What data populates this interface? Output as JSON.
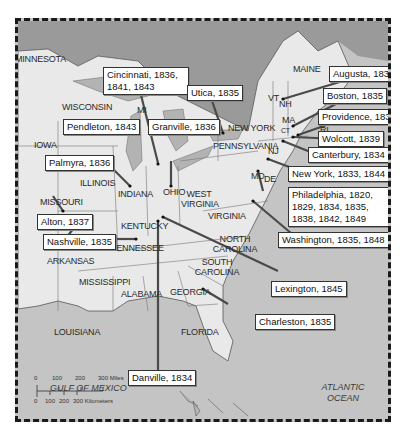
{
  "map": {
    "callouts": [
      {
        "id": "cincinnati",
        "label": "Cincinnati, 1836, 1841, 1843"
      },
      {
        "id": "utica",
        "label": "Utica, 1835"
      },
      {
        "id": "augusta",
        "label": "Augusta, 1834"
      },
      {
        "id": "boston",
        "label": "Boston, 1835"
      },
      {
        "id": "providence",
        "label": "Providence, 1831"
      },
      {
        "id": "wolcott",
        "label": "Wolcott, 1839"
      },
      {
        "id": "canterbury",
        "label": "Canterbury, 1834"
      },
      {
        "id": "newyork",
        "label": "New York, 1833, 1844"
      },
      {
        "id": "philadelphia",
        "label": "Philadelphia, 1820, 1829, 1834, 1835, 1838, 1842, 1849"
      },
      {
        "id": "washington",
        "label": "Washington, 1835, 1848"
      },
      {
        "id": "lexington",
        "label": "Lexington, 1845"
      },
      {
        "id": "charleston",
        "label": "Charleston, 1835"
      },
      {
        "id": "danville",
        "label": "Danville, 1834"
      },
      {
        "id": "nashville",
        "label": "Nashville, 1835"
      },
      {
        "id": "alton",
        "label": "Alton, 1837"
      },
      {
        "id": "palmyra",
        "label": "Palmyra, 1836"
      },
      {
        "id": "pendleton",
        "label": "Pendleton, 1843"
      },
      {
        "id": "granville",
        "label": "Granville, 1836"
      }
    ],
    "states": {
      "minnesota": "MINNESOTA",
      "wisconsin": "WISCONSIN",
      "mi": "MI",
      "iowa": "IOWA",
      "illinois": "ILLINOIS",
      "indiana": "INDIANA",
      "ohio": "OHIO",
      "missouri": "MISSOURI",
      "kentucky": "KENTUCKY",
      "west_virginia": "WEST VIRGINIA",
      "pennsylvania": "PENNSYLVANIA",
      "new_york": "NEW YORK",
      "vt": "VT",
      "nh": "NH",
      "maine": "MAINE",
      "ma": "MA",
      "ct": "CT",
      "ri": "RI",
      "nj": "NJ",
      "md": "MD",
      "de": "DE",
      "virginia": "VIRGINIA",
      "north_carolina": "NORTH CAROLINA",
      "south_carolina": "SOUTH CAROLINA",
      "tennessee": "TENNESSEE",
      "arkansas": "ARKANSAS",
      "mississippi": "MISSISSIPPI",
      "alabama": "ALABAMA",
      "georgia": "GEORGIA",
      "louisiana": "LOUISIANA",
      "florida": "FLORIDA"
    },
    "water": {
      "gulf": "GULF OF MEXICO",
      "atlantic": "ATLANTIC OCEAN"
    },
    "scale": {
      "miles_ticks": [
        "0",
        "100",
        "200",
        "300 Miles"
      ],
      "km_ticks": [
        "0",
        "100",
        "200",
        "300 Kilometers"
      ]
    },
    "colors": {
      "water": "#c4c4c4",
      "land": "#e9e9e9",
      "canada": "#9a9a9a",
      "leader": "#4a4a4a"
    }
  }
}
